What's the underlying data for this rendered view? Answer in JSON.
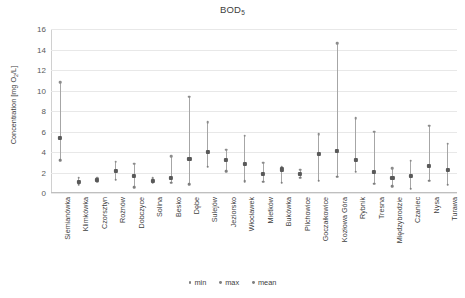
{
  "chart_data": {
    "type": "scatter",
    "title": "BOD5",
    "title_base": "BOD",
    "title_sub": "5",
    "xlabel": "",
    "ylabel": "Concentration [mg O2/L]",
    "ylabel_base": "Concentration [mg O",
    "ylabel_sub": "2",
    "ylabel_tail": "/L]",
    "ylim": [
      0,
      16
    ],
    "yticks": [
      0,
      2,
      4,
      6,
      8,
      10,
      12,
      14,
      16
    ],
    "grid": true,
    "legend_position": "bottom",
    "legend": [
      "min",
      "max",
      "mean"
    ],
    "categories": [
      "Siemianówka",
      "Klimkówka",
      "Czorsztyn",
      "Rożnów",
      "Dobczyce",
      "Solina",
      "Besko",
      "Dębe",
      "Sulejów",
      "Jeziorsko",
      "Włocławek",
      "Mietków",
      "Bukówka",
      "Pilchowice",
      "Goczałkowice",
      "Kozłowa Góra",
      "Rybnik",
      "Tresna",
      "Międzybrodzie",
      "Czaniec",
      "Nysa",
      "Turawa"
    ],
    "series": [
      {
        "name": "min",
        "values": [
          3.2,
          0.8,
          1.15,
          1.3,
          0.55,
          1.0,
          1.0,
          0.85,
          2.55,
          2.15,
          1.15,
          1.1,
          1.0,
          1.5,
          1.2,
          1.6,
          2.1,
          0.9,
          0.65,
          0.4,
          1.2,
          0.8
        ]
      },
      {
        "name": "max",
        "values": [
          10.8,
          1.5,
          1.45,
          3.05,
          2.85,
          1.45,
          3.6,
          9.4,
          6.9,
          4.2,
          5.6,
          2.95,
          2.5,
          2.25,
          5.75,
          14.6,
          7.3,
          6.0,
          2.4,
          3.15,
          6.55,
          4.8
        ]
      },
      {
        "name": "mean",
        "values": [
          5.4,
          1.05,
          1.3,
          2.15,
          1.65,
          1.15,
          1.5,
          3.3,
          4.05,
          3.2,
          2.85,
          1.9,
          2.3,
          1.85,
          3.8,
          4.1,
          3.25,
          2.1,
          1.45,
          1.7,
          2.65,
          2.25
        ]
      }
    ]
  }
}
